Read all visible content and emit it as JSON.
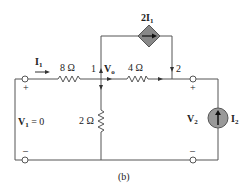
{
  "figure_label": "(b)",
  "labels": {
    "I1": "I",
    "I1_sub": "1",
    "r8": "8 Ω",
    "r4": "4 Ω",
    "r2": "2 Ω",
    "node1": "1",
    "node2": "2",
    "Vo": "V",
    "Vo_sub": "o",
    "dep_source": "2I",
    "dep_source_sub": "1",
    "V1": "V",
    "V1_sub": "1",
    "V1_eq": " = 0",
    "V2": "V",
    "V2_sub": "2",
    "I2": "I",
    "I2_sub": "2",
    "plus": "+",
    "minus": "–"
  },
  "colors": {
    "wire": "#555555",
    "source_fill": "#888888",
    "text": "#222222"
  }
}
